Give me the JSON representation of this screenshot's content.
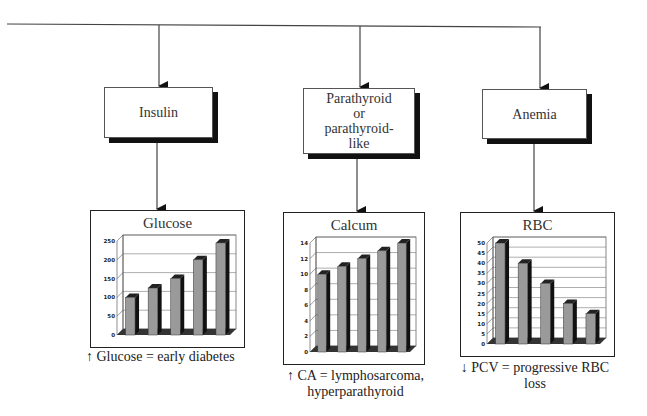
{
  "diagram": {
    "nodes": [
      {
        "id": "insulin",
        "label": "Insulin"
      },
      {
        "id": "parathyroid",
        "label": "Parathyroid or parathyroid-like",
        "lines": [
          "Parathyroid",
          "or",
          "parathyroid-",
          "like"
        ]
      },
      {
        "id": "anemia",
        "label": "Anemia"
      }
    ],
    "captions": [
      {
        "arrow": "↑",
        "text": "Glucose = early diabetes"
      },
      {
        "arrow": "↑",
        "lines": [
          "CA = lymphosarcoma,",
          "hyperparathyroid"
        ]
      },
      {
        "arrow": "↓",
        "lines": [
          "PCV = progressive RBC",
          "loss"
        ]
      }
    ],
    "colors": {
      "line": "#444",
      "bar_face": "#9a9a9a",
      "bar_side": "#111",
      "floor": "#333",
      "shadow": "#111"
    }
  },
  "chart_data": [
    {
      "type": "bar",
      "title": "Glucose",
      "categories": [
        "1",
        "2",
        "3",
        "4",
        "5"
      ],
      "values": [
        100,
        125,
        150,
        200,
        245
      ],
      "yticks": [
        0,
        50,
        100,
        150,
        200,
        250
      ],
      "ylim": [
        0,
        250
      ],
      "xlabel": "",
      "ylabel": "",
      "grid": true,
      "style": "3d"
    },
    {
      "type": "bar",
      "title": "Calcum",
      "categories": [
        "1",
        "2",
        "3",
        "4",
        "5"
      ],
      "values": [
        10,
        11,
        12,
        13,
        14
      ],
      "yticks": [
        0,
        2,
        4,
        6,
        8,
        10,
        12,
        14
      ],
      "ylim": [
        0,
        14
      ],
      "xlabel": "",
      "ylabel": "",
      "grid": true,
      "style": "3d"
    },
    {
      "type": "bar",
      "title": "RBC",
      "categories": [
        "1",
        "2",
        "3",
        "4",
        "5"
      ],
      "values": [
        50,
        40,
        30,
        20,
        15
      ],
      "yticks": [
        0,
        5,
        10,
        15,
        20,
        25,
        30,
        35,
        40,
        45,
        50
      ],
      "ylim": [
        0,
        50
      ],
      "xlabel": "",
      "ylabel": "",
      "grid": true,
      "style": "3d"
    }
  ]
}
